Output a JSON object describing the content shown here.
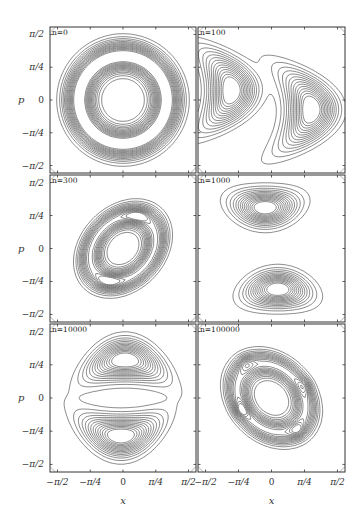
{
  "figure": {
    "ylabel": "p",
    "xlabel": "x",
    "xticks": [
      "−π/2",
      "−π/4",
      "0",
      "π/4",
      "π/2"
    ],
    "yticks": [
      "π/2",
      "π/4",
      "0",
      "−π/4",
      "−π/2"
    ]
  },
  "panels": [
    {
      "label": "n = 0"
    },
    {
      "label": "n = 100"
    },
    {
      "label": "n = 300"
    },
    {
      "label": "n = 1000"
    },
    {
      "label": "n = 10000"
    },
    {
      "label": "n = 100000"
    }
  ],
  "chart_data": {
    "type": "heatmap",
    "subtype": "contour",
    "title": "",
    "layout": {
      "rows": 3,
      "cols": 2,
      "grid": false,
      "legend": null
    },
    "xlabel": "x",
    "ylabel": "p",
    "xlim": [
      -1.75,
      1.75
    ],
    "ylim": [
      -1.75,
      1.75
    ],
    "xtick_labels": [
      "−π/2",
      "−π/4",
      "0",
      "π/4",
      "π/2"
    ],
    "ytick_labels": [
      "π/2",
      "π/4",
      "0",
      "−π/4",
      "−π/2"
    ],
    "panels": [
      {
        "label": "n = 0",
        "description": "concentric circular ring contours centered at origin, empty center radius ~π/4·0.8, outer radius ~π/2·0.95",
        "peaks": []
      },
      {
        "label": "n = 100",
        "description": "two crescent-shaped lobes",
        "peaks": [
          [
            -0.95,
            0.23
          ],
          [
            0.95,
            -0.23
          ]
        ]
      },
      {
        "label": "n = 300",
        "description": "tilted elliptical ring with two maxima",
        "peaks": [
          [
            0.35,
            0.77
          ],
          [
            -0.35,
            -0.77
          ]
        ]
      },
      {
        "label": "n = 1000",
        "description": "two separated lobes, upper and lower",
        "peaks": [
          [
            -0.1,
            0.97
          ],
          [
            0.1,
            -0.97
          ]
        ]
      },
      {
        "label": "n = 10000",
        "description": "two crescent lobes opening toward each other",
        "peaks": [
          [
            0.05,
            0.9
          ],
          [
            -0.05,
            -0.9
          ]
        ]
      },
      {
        "label": "n = 100000",
        "description": "distorted ring with four maxima",
        "peaks": [
          [
            -0.65,
            0.87
          ],
          [
            0.85,
            0.33
          ],
          [
            -0.75,
            -0.3
          ],
          [
            0.65,
            -0.8
          ]
        ]
      }
    ]
  }
}
